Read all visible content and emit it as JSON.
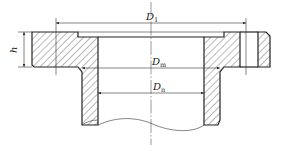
{
  "diagram": {
    "type": "engineering-drawing",
    "dimensions": [
      {
        "id": "D1",
        "symbol": "D",
        "subscript": "1"
      },
      {
        "id": "Dm",
        "symbol": "D",
        "subscript": "m"
      },
      {
        "id": "Dn",
        "symbol": "D",
        "subscript": "n"
      },
      {
        "id": "h",
        "symbol": "h",
        "subscript": ""
      }
    ]
  },
  "labels": {
    "d1_main": "D",
    "d1_sub": "1",
    "dm_main": "D",
    "dm_sub": "m",
    "dn_main": "D",
    "dn_sub": "n",
    "h": "h"
  },
  "colors": {
    "line": "#222222",
    "background": "#ffffff"
  }
}
